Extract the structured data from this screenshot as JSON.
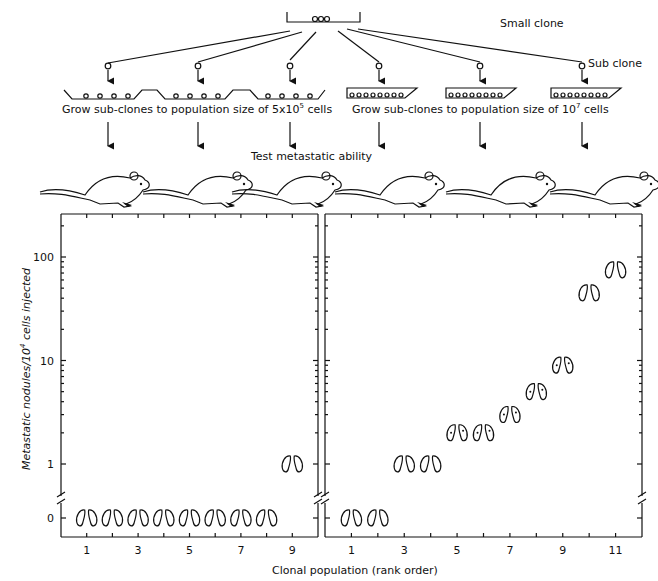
{
  "diagram": {
    "small_clone_label": "Small clone",
    "sub_clone_label": "Sub clone",
    "grow_left_prefix": "Grow sub-clones to population size of 5x10",
    "grow_left_exp": "5",
    "grow_left_suffix": " cells",
    "grow_right_prefix": "Grow sub-clones to population size of 10",
    "grow_right_exp": "7",
    "grow_right_suffix": " cells",
    "test_label": "Test metastatic ability",
    "mouse_count": 6,
    "icons": {
      "mouse": "mouse-icon",
      "lungs": "lungs-icon",
      "dish": "culture-dish-icon",
      "cell": "cell-icon"
    }
  },
  "chart_data": {
    "type": "scatter",
    "ylabel_prefix": "Metastatic nodules/10",
    "ylabel_exp": "4",
    "ylabel_suffix": " cells injected",
    "xlabel": "Clonal population (rank order)",
    "yscale": "log with broken axis at 0",
    "y_ticks": [
      "100",
      "10",
      "1",
      "0"
    ],
    "panels": [
      {
        "name": "5x10^5 cells",
        "x_ticks": [
          "1",
          "3",
          "5",
          "7",
          "9"
        ],
        "xlim": [
          0,
          10
        ],
        "points": [
          {
            "x": 1,
            "y": 0
          },
          {
            "x": 2,
            "y": 0
          },
          {
            "x": 3,
            "y": 0
          },
          {
            "x": 4,
            "y": 0
          },
          {
            "x": 5,
            "y": 0
          },
          {
            "x": 6,
            "y": 0
          },
          {
            "x": 7,
            "y": 0
          },
          {
            "x": 8,
            "y": 0
          },
          {
            "x": 9,
            "y": 1
          }
        ]
      },
      {
        "name": "10^7 cells",
        "x_ticks": [
          "1",
          "3",
          "5",
          "7",
          "9",
          "11"
        ],
        "xlim": [
          0,
          12
        ],
        "points": [
          {
            "x": 1,
            "y": 0
          },
          {
            "x": 2,
            "y": 0
          },
          {
            "x": 3,
            "y": 1
          },
          {
            "x": 4,
            "y": 1
          },
          {
            "x": 5,
            "y": 2
          },
          {
            "x": 6,
            "y": 2
          },
          {
            "x": 7,
            "y": 3
          },
          {
            "x": 8,
            "y": 5
          },
          {
            "x": 9,
            "y": 9
          },
          {
            "x": 10,
            "y": 45
          },
          {
            "x": 11,
            "y": 75
          }
        ]
      }
    ]
  }
}
